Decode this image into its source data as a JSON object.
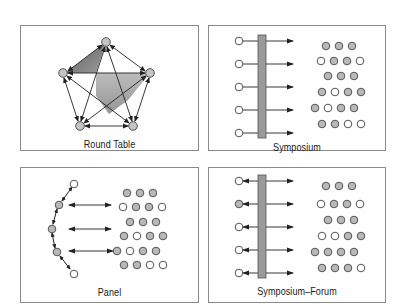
{
  "diagram": {
    "colors": {
      "border": "#8a8a8a",
      "node_fill_gray": "#b8b8b8",
      "node_fill_white": "#ffffff",
      "node_stroke": "#555555",
      "bar_fill": "#9a9a9a",
      "bar_stroke": "#555555",
      "arrow": "#222222",
      "shade_dark": "#7a7a7a",
      "shade_mid": "#a8a8a8"
    },
    "panels": [
      {
        "id": "round-table",
        "label": "Round Table",
        "nodes": [
          {
            "x": 85,
            "y": 16
          },
          {
            "x": 42,
            "y": 47
          },
          {
            "x": 129,
            "y": 47
          },
          {
            "x": 59,
            "y": 100
          },
          {
            "x": 112,
            "y": 100
          }
        ]
      },
      {
        "id": "symposium",
        "label": "Symposium",
        "speakers": 5,
        "audience_rows": [
          3,
          4,
          3,
          4,
          4,
          4
        ]
      },
      {
        "id": "panel",
        "label": "Panel",
        "speakers": 5,
        "audience_rows": [
          3,
          4,
          3,
          4,
          4,
          4
        ]
      },
      {
        "id": "symposium-forum",
        "label": "Symposium–Forum",
        "speakers": 5,
        "audience_rows": [
          3,
          4,
          3,
          4,
          4,
          4
        ]
      }
    ]
  }
}
